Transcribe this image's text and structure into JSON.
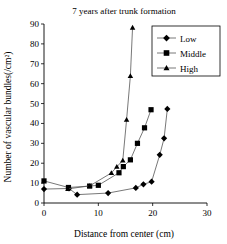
{
  "chart_data": {
    "type": "line",
    "title": "7 years after trunk formation",
    "xlabel": "Distance from center (cm)",
    "ylabel": "Number of vascular bundles(/cm²)",
    "xlim": [
      0,
      30
    ],
    "ylim": [
      0,
      90
    ],
    "xticks": [
      0,
      10,
      20,
      30
    ],
    "yticks": [
      0,
      10,
      20,
      30,
      40,
      50,
      60,
      70,
      80,
      90
    ],
    "grid": false,
    "legend_position": "top-right",
    "series": [
      {
        "name": "Low",
        "marker": "diamond",
        "points": [
          [
            0.0,
            7.0
          ],
          [
            4.6,
            7.3
          ],
          [
            6.1,
            4.2
          ],
          [
            11.8,
            5.0
          ],
          [
            16.9,
            7.6
          ],
          [
            18.3,
            9.4
          ],
          [
            19.8,
            10.7
          ],
          [
            21.3,
            24.2
          ],
          [
            22.1,
            32.5
          ],
          [
            22.7,
            47.3
          ]
        ]
      },
      {
        "name": "Middle",
        "marker": "square",
        "points": [
          [
            0.0,
            11.1
          ],
          [
            4.5,
            7.8
          ],
          [
            8.4,
            8.5
          ],
          [
            10.0,
            8.9
          ],
          [
            13.8,
            15.2
          ],
          [
            14.6,
            18.3
          ],
          [
            15.9,
            21.7
          ],
          [
            17.2,
            30.0
          ],
          [
            18.5,
            37.8
          ],
          [
            19.7,
            46.9
          ]
        ]
      },
      {
        "name": "High",
        "marker": "triangle",
        "points": [
          [
            4.4,
            7.1
          ],
          [
            8.4,
            8.6
          ],
          [
            12.4,
            15.1
          ],
          [
            13.4,
            18.2
          ],
          [
            14.5,
            21.4
          ],
          [
            15.2,
            41.9
          ],
          [
            15.9,
            63.9
          ],
          [
            16.3,
            88.2
          ]
        ]
      }
    ]
  }
}
